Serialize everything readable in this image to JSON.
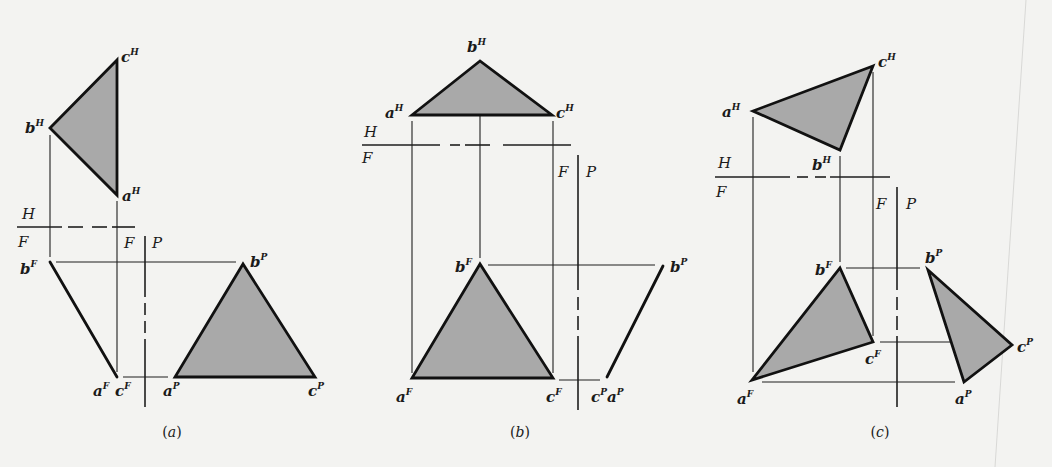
{
  "figure": {
    "fill_color": "#a9a9a9",
    "line_color": "#111111",
    "background": "#f3f3f1",
    "page_edge": {
      "x1": 1026,
      "y1": 0,
      "x2": 995,
      "y2": 467,
      "color": "#d8d8d6"
    }
  },
  "panels": [
    {
      "id": "a",
      "caption": "(a)",
      "caption_pos": [
        172,
        437
      ],
      "triangles": [
        {
          "view": "H",
          "points": [
            [
              117,
              60
            ],
            [
              50,
              128
            ],
            [
              117,
              195
            ]
          ]
        },
        {
          "view": "P",
          "points": [
            [
              243,
              264
            ],
            [
              175,
              377
            ],
            [
              315,
              377
            ]
          ]
        }
      ],
      "edge_views": [
        {
          "view": "F",
          "from": [
            50,
            262
          ],
          "to": [
            117,
            377
          ]
        }
      ],
      "projection_lines": [
        [
          50,
          135,
          50,
          257
        ],
        [
          117,
          201,
          117,
          372
        ],
        [
          56,
          262,
          236,
          262
        ],
        [
          123,
          377,
          168,
          377
        ]
      ],
      "fold_lines": [
        {
          "name": "H-F",
          "segments": [
            [
              17,
              227,
              62,
              227
            ],
            [
              68,
              227,
              83,
              227
            ],
            [
              92,
              227,
              107,
              227
            ],
            [
              112,
              227,
              135,
              227
            ]
          ]
        },
        {
          "name": "F-P",
          "segments": [
            [
              145,
              236,
              145,
              297
            ],
            [
              145,
              303,
              145,
              315
            ],
            [
              145,
              321,
              145,
              333
            ],
            [
              145,
              339,
              145,
              407
            ]
          ]
        }
      ],
      "plane_labels": [
        {
          "text": "H",
          "x": 22,
          "y": 219
        },
        {
          "text": "F",
          "x": 18,
          "y": 247
        },
        {
          "text": "F",
          "x": 124,
          "y": 248
        },
        {
          "text": "P",
          "x": 152,
          "y": 248
        }
      ],
      "point_labels": [
        {
          "base": "c",
          "sup": "H",
          "x": 121,
          "y": 62
        },
        {
          "base": "b",
          "sup": "H",
          "x": 25,
          "y": 133
        },
        {
          "base": "a",
          "sup": "H",
          "x": 122,
          "y": 201
        },
        {
          "base": "b",
          "sup": "F",
          "x": 20,
          "y": 274
        },
        {
          "base": "a",
          "sup": "F",
          "x": 93,
          "y": 396
        },
        {
          "base": "c",
          "sup": "F",
          "x": 115,
          "y": 396
        },
        {
          "base": "a",
          "sup": "P",
          "x": 163,
          "y": 396
        },
        {
          "base": "b",
          "sup": "P",
          "x": 250,
          "y": 267
        },
        {
          "base": "c",
          "sup": "P",
          "x": 308,
          "y": 396
        }
      ]
    },
    {
      "id": "b",
      "caption": "(b)",
      "caption_pos": [
        520,
        437
      ],
      "triangles": [
        {
          "view": "H",
          "points": [
            [
              480,
              61
            ],
            [
              412,
              115
            ],
            [
              552,
              115
            ]
          ]
        },
        {
          "view": "F",
          "points": [
            [
              480,
              264
            ],
            [
              412,
              378
            ],
            [
              553,
              378
            ]
          ]
        }
      ],
      "edge_views": [
        {
          "view": "P",
          "from": [
            663,
            266
          ],
          "to": [
            607,
            377
          ]
        }
      ],
      "projection_lines": [
        [
          412,
          121,
          412,
          373
        ],
        [
          480,
          61,
          480,
          258
        ],
        [
          553,
          121,
          553,
          373
        ],
        [
          488,
          265,
          655,
          265
        ],
        [
          559,
          380,
          600,
          380
        ]
      ],
      "fold_lines": [
        {
          "name": "H-F",
          "segments": [
            [
              362,
              145,
              440,
              145
            ],
            [
              450,
              145,
              460,
              145
            ],
            [
              465,
              145,
              480,
              145
            ],
            [
              480,
              145,
              490,
              145
            ],
            [
              503,
              145,
              571,
              145
            ]
          ]
        },
        {
          "name": "F-P",
          "segments": [
            [
              578,
              155,
              578,
              290
            ],
            [
              578,
              297,
              578,
              310
            ],
            [
              578,
              316,
              578,
              330
            ],
            [
              578,
              336,
              578,
              410
            ]
          ]
        }
      ],
      "plane_labels": [
        {
          "text": "H",
          "x": 364,
          "y": 137
        },
        {
          "text": "F",
          "x": 362,
          "y": 163
        },
        {
          "text": "F",
          "x": 558,
          "y": 177
        },
        {
          "text": "P",
          "x": 586,
          "y": 177
        }
      ],
      "point_labels": [
        {
          "base": "b",
          "sup": "H",
          "x": 467,
          "y": 52
        },
        {
          "base": "a",
          "sup": "H",
          "x": 385,
          "y": 118
        },
        {
          "base": "c",
          "sup": "H",
          "x": 556,
          "y": 118
        },
        {
          "base": "b",
          "sup": "F",
          "x": 455,
          "y": 272
        },
        {
          "base": "b",
          "sup": "P",
          "x": 670,
          "y": 272
        },
        {
          "base": "a",
          "sup": "F",
          "x": 396,
          "y": 402
        },
        {
          "base": "c",
          "sup": "F",
          "x": 546,
          "y": 402
        },
        {
          "base": "c",
          "sup": "P",
          "x": 591,
          "y": 402
        },
        {
          "base": "a",
          "sup": "P",
          "x": 607,
          "y": 402
        }
      ]
    },
    {
      "id": "c",
      "caption": "(c)",
      "caption_pos": [
        880,
        437
      ],
      "triangles": [
        {
          "view": "H",
          "points": [
            [
              873,
              66
            ],
            [
              753,
              111
            ],
            [
              840,
              150
            ]
          ]
        },
        {
          "view": "F",
          "points": [
            [
              840,
              268
            ],
            [
              873,
              342
            ],
            [
              752,
              380
            ]
          ]
        },
        {
          "view": "P",
          "points": [
            [
              928,
              270
            ],
            [
              1012,
              345
            ],
            [
              964,
              382
            ]
          ]
        }
      ],
      "edge_views": [],
      "projection_lines": [
        [
          753,
          117,
          753,
          372
        ],
        [
          840,
          156,
          840,
          262
        ],
        [
          873,
          72,
          873,
          336
        ],
        [
          846,
          268,
          920,
          268
        ],
        [
          880,
          342,
          1008,
          342
        ],
        [
          762,
          382,
          955,
          382
        ]
      ],
      "fold_lines": [
        {
          "name": "H-F",
          "segments": [
            [
              715,
              177,
              790,
              177
            ],
            [
              797,
              177,
              808,
              177
            ],
            [
              815,
              177,
              826,
              177
            ],
            [
              830,
              177,
              890,
              177
            ]
          ]
        },
        {
          "name": "F-P",
          "segments": [
            [
              897,
              187,
              897,
              290
            ],
            [
              897,
              297,
              897,
              310
            ],
            [
              897,
              316,
              897,
              330
            ],
            [
              897,
              336,
              897,
              407
            ]
          ]
        }
      ],
      "plane_labels": [
        {
          "text": "H",
          "x": 718,
          "y": 168
        },
        {
          "text": "F",
          "x": 716,
          "y": 197
        },
        {
          "text": "F",
          "x": 876,
          "y": 209
        },
        {
          "text": "P",
          "x": 906,
          "y": 209
        }
      ],
      "point_labels": [
        {
          "base": "c",
          "sup": "H",
          "x": 878,
          "y": 67
        },
        {
          "base": "a",
          "sup": "H",
          "x": 722,
          "y": 117
        },
        {
          "base": "b",
          "sup": "H",
          "x": 812,
          "y": 170
        },
        {
          "base": "b",
          "sup": "F",
          "x": 815,
          "y": 275
        },
        {
          "base": "b",
          "sup": "P",
          "x": 925,
          "y": 263
        },
        {
          "base": "c",
          "sup": "F",
          "x": 865,
          "y": 364
        },
        {
          "base": "c",
          "sup": "P",
          "x": 1017,
          "y": 352
        },
        {
          "base": "a",
          "sup": "F",
          "x": 737,
          "y": 404
        },
        {
          "base": "a",
          "sup": "P",
          "x": 955,
          "y": 404
        }
      ]
    }
  ]
}
